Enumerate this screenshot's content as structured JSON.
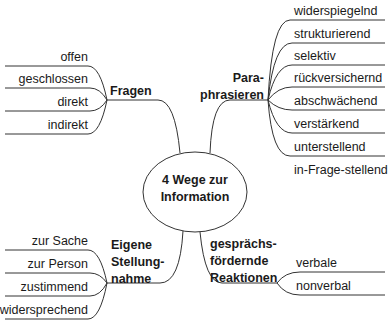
{
  "center": {
    "line1": "4 Wege zur",
    "line2": "Information"
  },
  "branches": {
    "fragen": {
      "label": "Fragen",
      "items": [
        "offen",
        "geschlossen",
        "direkt",
        "indirekt"
      ]
    },
    "paraphrasieren": {
      "line1": "Para-",
      "line2": "phrasieren",
      "items": [
        "widerspiegelnd",
        "strukturierend",
        "selektiv",
        "rückversichernd",
        "abschwächend",
        "verstärkend",
        "unterstellend",
        "in-Frage-stellend"
      ]
    },
    "stellungnahme": {
      "line1": "Eigene",
      "line2": "Stellung-",
      "line3": "nahme",
      "items": [
        "zur Sache",
        "zur Person",
        "zustimmend",
        "widersprechend"
      ]
    },
    "reaktionen": {
      "line1": "gesprächs-",
      "line2": "fördernde",
      "line3": "Reaktionen",
      "items": [
        "verbale",
        "nonverbal"
      ]
    }
  },
  "colors": {
    "line": "#333333",
    "text": "#1a1a1a"
  }
}
